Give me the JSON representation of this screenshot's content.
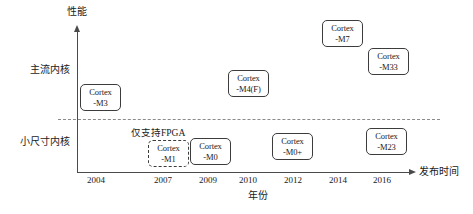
{
  "chart_data": {
    "type": "scatter",
    "title": "",
    "xlabel": "年份",
    "ylabel": "性能",
    "x_axis_title": "发布时间",
    "grid": false,
    "legend": "none",
    "x_tick_labels": [
      "2004",
      "2007",
      "2009",
      "2010",
      "2012",
      "2014",
      "2016"
    ],
    "x_tick_positions_px": [
      96,
      163,
      208,
      248,
      293,
      338,
      382
    ],
    "y_band_labels": [
      "主流内核",
      "小尺寸内核"
    ],
    "divider_note": "虚线分隔主流内核与小尺寸内核",
    "annotations": [
      {
        "text": "仅支持FPGA",
        "attached_to": "Cortex-M1"
      }
    ],
    "points": [
      {
        "label_line1": "Cortex",
        "label_line2": "-M3",
        "name": "Cortex-M3",
        "year": 2004,
        "band": "主流内核",
        "dashed": false,
        "x": 80,
        "y": 84
      },
      {
        "label_line1": "Cortex",
        "label_line2": "-M1",
        "name": "Cortex-M1",
        "year": 2007,
        "band": "小尺寸内核",
        "dashed": true,
        "x": 148,
        "y": 140
      },
      {
        "label_line1": "Cortex",
        "label_line2": "-M0",
        "name": "Cortex-M0",
        "year": 2009,
        "band": "小尺寸内核",
        "dashed": false,
        "x": 190,
        "y": 138
      },
      {
        "label_line1": "Cortex",
        "label_line2": "-M4(F)",
        "name": "Cortex-M4(F)",
        "year": 2010,
        "band": "主流内核",
        "dashed": false,
        "x": 228,
        "y": 70
      },
      {
        "label_line1": "Cortex",
        "label_line2": "-M0+",
        "name": "Cortex-M0+",
        "year": 2012,
        "band": "小尺寸内核",
        "dashed": false,
        "x": 272,
        "y": 133
      },
      {
        "label_line1": "Cortex",
        "label_line2": "-M7",
        "name": "Cortex-M7",
        "year": 2014,
        "band": "主流内核",
        "dashed": false,
        "x": 322,
        "y": 20
      },
      {
        "label_line1": "Cortex",
        "label_line2": "-M23",
        "name": "Cortex-M23",
        "year": 2016,
        "band": "小尺寸内核",
        "dashed": false,
        "x": 366,
        "y": 128
      },
      {
        "label_line1": "Cortex",
        "label_line2": "-M33",
        "name": "Cortex-M33",
        "year": 2016,
        "band": "主流内核",
        "dashed": false,
        "x": 368,
        "y": 48
      }
    ],
    "colors": {
      "axis": "#4a4a4a",
      "box_border": "#3c3c3c",
      "divider": "#8a8a8a",
      "text": "#1a1a1a",
      "background": "#ffffff"
    }
  }
}
